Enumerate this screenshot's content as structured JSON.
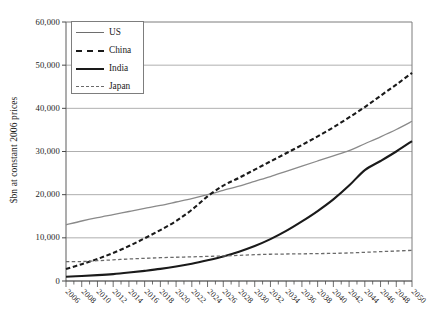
{
  "chart_data": {
    "type": "line",
    "title": "",
    "subtitle": "",
    "xlabel": "",
    "ylabel": "$bn at constant 2006 prices",
    "xlim": [
      2006,
      2050
    ],
    "ylim": [
      0,
      60000
    ],
    "ytick_labels": [
      "60,000",
      "50,000",
      "40,000",
      "30,000",
      "20,000",
      "10,000",
      "0"
    ],
    "ytick_values": [
      60000,
      50000,
      40000,
      30000,
      20000,
      10000,
      0
    ],
    "ytick_step": 10000,
    "grid": "horizontal",
    "minor_x_tick_step": 1,
    "major_x_tick_step": 2,
    "legend_position": "top-left-inside",
    "x": [
      2006,
      2008,
      2010,
      2012,
      2014,
      2016,
      2018,
      2020,
      2022,
      2024,
      2026,
      2028,
      2030,
      2032,
      2034,
      2036,
      2038,
      2040,
      2042,
      2044,
      2046,
      2048,
      2050
    ],
    "xtick_labels": [
      "2006",
      "2008",
      "2010",
      "2012",
      "2014",
      "2016",
      "2018",
      "2020",
      "2022",
      "2024",
      "2026",
      "2028",
      "2030",
      "2032",
      "2034",
      "2036",
      "2038",
      "2040",
      "2042",
      "2044",
      "2046",
      "2048",
      "2050"
    ],
    "series": [
      {
        "name": "US",
        "style": "solid",
        "color": "#8a8a8a",
        "width": 1.3,
        "values": [
          13000,
          13900,
          14700,
          15400,
          16100,
          16800,
          17500,
          18300,
          19100,
          20000,
          21000,
          22000,
          23100,
          24200,
          25400,
          26600,
          27800,
          29000,
          30200,
          31800,
          33400,
          35100,
          37000
        ]
      },
      {
        "name": "China",
        "style": "dashed",
        "color": "#1a1a1a",
        "width": 2.1,
        "values": [
          2800,
          3900,
          5100,
          6500,
          8100,
          9900,
          11800,
          13900,
          16500,
          19600,
          22100,
          23900,
          25800,
          27700,
          29600,
          31500,
          33500,
          35600,
          37900,
          40300,
          42900,
          45500,
          48200
        ]
      },
      {
        "name": "India",
        "style": "solid",
        "color": "#1a1a1a",
        "width": 2.1,
        "values": [
          1000,
          1150,
          1350,
          1600,
          1950,
          2350,
          2800,
          3350,
          4000,
          4800,
          5700,
          6800,
          8100,
          9700,
          11600,
          13800,
          16200,
          18900,
          22100,
          25700,
          27800,
          30000,
          32400
        ]
      },
      {
        "name": "Japan",
        "style": "dashed",
        "color": "#6a6a6a",
        "width": 1.3,
        "values": [
          4500,
          4500,
          4700,
          4900,
          5100,
          5250,
          5400,
          5500,
          5600,
          5700,
          5800,
          5950,
          6100,
          6200,
          6250,
          6300,
          6350,
          6400,
          6500,
          6650,
          6800,
          6950,
          7100
        ]
      }
    ]
  },
  "legend": {
    "items": [
      {
        "label": "US"
      },
      {
        "label": "China"
      },
      {
        "label": "India"
      },
      {
        "label": "Japan"
      }
    ]
  }
}
